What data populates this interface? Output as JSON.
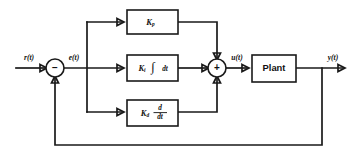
{
  "diagram": {
    "type": "control-block-diagram",
    "background_color": "#ffffff",
    "line_color": "#1a1a1a",
    "signals": {
      "reference": "r(t)",
      "error": "e(t)",
      "control": "u(t)",
      "output": "y(t)"
    },
    "summing_junctions": [
      {
        "id": "error-junction",
        "sign_in": "-",
        "sign_glyph": "−",
        "x": 55,
        "y": 68
      },
      {
        "id": "control-junction",
        "sign_in": "+",
        "sign_glyph": "+",
        "x": 217,
        "y": 68
      }
    ],
    "branches": [
      {
        "id": "proportional",
        "gain_symbol": "K",
        "gain_subscript": "p",
        "operator": "",
        "full_label": "K_p",
        "x": 127,
        "y": 10,
        "w": 51,
        "h": 24
      },
      {
        "id": "integral",
        "gain_symbol": "K",
        "gain_subscript": "i",
        "operator": "∫ dt",
        "full_label": "K_i ∫ dt",
        "integral_glyph": "∫",
        "differential": "dt",
        "x": 127,
        "y": 55,
        "w": 51,
        "h": 26
      },
      {
        "id": "derivative",
        "gain_symbol": "K",
        "gain_subscript": "d",
        "operator": "d/dt",
        "full_label": "K_d d/dt",
        "numerator": "d",
        "denominator": "dt",
        "x": 127,
        "y": 100,
        "w": 51,
        "h": 26
      }
    ],
    "plant": {
      "label": "Plant",
      "x": 252,
      "y": 55,
      "w": 44,
      "h": 27
    },
    "feedback": {
      "tap_x": 322,
      "bottom_y": 145,
      "return_x": 55
    }
  }
}
